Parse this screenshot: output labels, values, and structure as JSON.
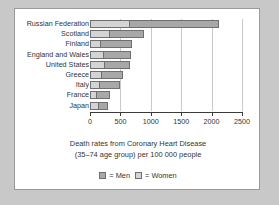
{
  "chart_data": {
    "type": "bar",
    "orientation": "horizontal",
    "stacked": true,
    "title": "",
    "caption_line_1": "Death rates from Coronary Heart Disease",
    "caption_line_2": "(35–74 age group) per 100 000 people",
    "xlabel": "",
    "ylabel": "",
    "xlim": [
      0,
      2500
    ],
    "grid": true,
    "legend_position": "bottom",
    "tick_values": [
      0,
      500,
      1000,
      1500,
      2000,
      2500
    ],
    "tick_labels": [
      "0",
      "500",
      "1000",
      "1500",
      "2000",
      "2500"
    ],
    "categories": [
      "Russian Federation",
      "Scotland",
      "Finland",
      "England and Wales",
      "United States",
      "Greece",
      "Italy",
      "France",
      "Japan"
    ],
    "series": [
      {
        "name": "Women",
        "color": "#d4d4d4",
        "values": [
          620,
          290,
          150,
          190,
          210,
          170,
          130,
          80,
          110
        ]
      },
      {
        "name": "Men",
        "color": "#a8a8a8",
        "values": [
          1500,
          590,
          540,
          490,
          450,
          370,
          370,
          250,
          190
        ]
      }
    ],
    "totals": [
      2120,
      880,
      690,
      680,
      660,
      540,
      500,
      330,
      300
    ]
  },
  "legend": {
    "men_label": "= Men",
    "women_label": "= Women"
  }
}
